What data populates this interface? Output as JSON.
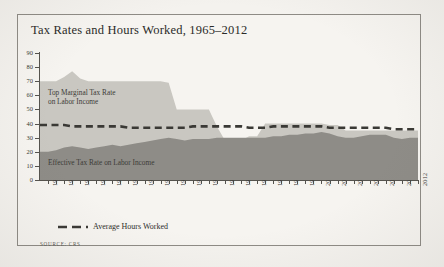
{
  "figure": {
    "title": "Tax Rates and Hours Worked, 1965–2012",
    "source": "SOURCE: CRS",
    "frame_color": "#8e8b85",
    "paper_color": "#f4f2ee"
  },
  "legend": {
    "items": [
      {
        "label": "Average Hours Worked",
        "style": "dashed",
        "color": "#3a3935"
      }
    ]
  },
  "annotations": {
    "top_marginal": "Top Marginal Tax Rate\non Labor Income",
    "top_marginal_line1": "Top Marginal Tax Rate",
    "top_marginal_line2": "on Labor Income",
    "effective": "Effective Tax Rate on Labor Income"
  },
  "chart_data": {
    "type": "area",
    "title": "Tax Rates and Hours Worked, 1965–2012",
    "xlabel": "",
    "ylabel": "",
    "ylim": [
      0,
      90
    ],
    "yticks": [
      0,
      10,
      20,
      30,
      40,
      50,
      60,
      70,
      80,
      90
    ],
    "grid": false,
    "legend_position": "below-axis-left",
    "xlim": [
      1965,
      2012
    ],
    "xticks": [
      1966,
      1968,
      1970,
      1972,
      1974,
      1976,
      1978,
      1980,
      1982,
      1984,
      1986,
      1988,
      1990,
      1992,
      1994,
      1996,
      1998,
      2000,
      2002,
      2004,
      2006,
      2008,
      2010,
      2012
    ],
    "x": [
      1965,
      1966,
      1967,
      1968,
      1969,
      1970,
      1971,
      1972,
      1973,
      1974,
      1975,
      1976,
      1977,
      1978,
      1979,
      1980,
      1981,
      1982,
      1983,
      1984,
      1985,
      1986,
      1987,
      1988,
      1989,
      1990,
      1991,
      1992,
      1993,
      1994,
      1995,
      1996,
      1997,
      1998,
      1999,
      2000,
      2001,
      2002,
      2003,
      2004,
      2005,
      2006,
      2007,
      2008,
      2009,
      2010,
      2011,
      2012
    ],
    "series": [
      {
        "name": "Top Marginal Tax Rate on Labor Income",
        "type": "area",
        "color": "#c9c7c1",
        "values": [
          70,
          70,
          70,
          73,
          77,
          72,
          70,
          70,
          70,
          70,
          70,
          70,
          70,
          70,
          70,
          70,
          69,
          50,
          50,
          50,
          50,
          50,
          38,
          28,
          28,
          28,
          31,
          31,
          40,
          40,
          40,
          40,
          40,
          40,
          40,
          40,
          39,
          39,
          35,
          35,
          35,
          35,
          35,
          35,
          35,
          35,
          35,
          35
        ]
      },
      {
        "name": "Effective Tax Rate on Labor Income",
        "type": "area",
        "color": "#8e8c87",
        "values": [
          20,
          20,
          21,
          23,
          24,
          23,
          22,
          23,
          24,
          25,
          24,
          25,
          26,
          27,
          28,
          29,
          30,
          29,
          28,
          29,
          29,
          29,
          30,
          30,
          30,
          30,
          30,
          30,
          30,
          31,
          31,
          32,
          32,
          33,
          33,
          34,
          33,
          31,
          30,
          30,
          31,
          32,
          32,
          32,
          30,
          29,
          30,
          30
        ]
      },
      {
        "name": "Average Hours Worked",
        "type": "line",
        "style": "dashed",
        "color": "#3a3935",
        "values": [
          39,
          39,
          39,
          39,
          38,
          38,
          38,
          38,
          38,
          38,
          38,
          37,
          37,
          37,
          37,
          37,
          37,
          37,
          37,
          38,
          38,
          38,
          38,
          38,
          38,
          38,
          37,
          37,
          37,
          38,
          38,
          38,
          38,
          38,
          38,
          38,
          37,
          37,
          37,
          37,
          37,
          37,
          37,
          37,
          36,
          36,
          36,
          36
        ]
      }
    ]
  }
}
